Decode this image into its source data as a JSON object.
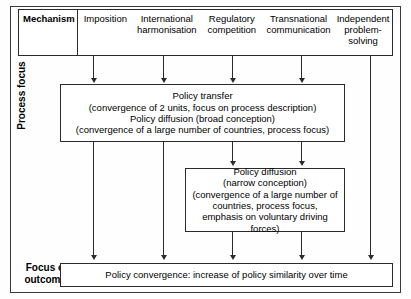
{
  "header": {
    "row_label": "Mechanism",
    "columns": [
      {
        "label": "Imposition"
      },
      {
        "label": "International harmonisation"
      },
      {
        "label": "Regulatory competition"
      },
      {
        "label": "Transnational communication"
      },
      {
        "label": "Independent problem-solving"
      }
    ]
  },
  "axis_labels": {
    "process_focus": "Process focus",
    "focus_on_outcomes": "Focus on\noutcomes",
    "focus_on_outcomes_line1": "Focus on",
    "focus_on_outcomes_line2": "outcomes"
  },
  "boxes": {
    "policy_transfer": {
      "name": "Policy transfer / Policy diffusion (broad conception)",
      "lines": [
        "Policy transfer",
        "(convergence of  2 units, focus on process description)",
        "Policy diffusion (broad conception)",
        "(convergence of a large number of countries, process focus)"
      ]
    },
    "policy_diffusion_narrow": {
      "name": "Policy diffusion (narrow conception)",
      "lines": [
        "Policy diffusion",
        "(narrow conception)",
        "(convergence of a large number of countries, process focus, emphasis on voluntary driving forces)"
      ]
    },
    "policy_convergence": {
      "name": "Policy convergence outcome",
      "lines": [
        "Policy convergence: increase of policy similarity over time"
      ]
    }
  },
  "connectors": [
    {
      "name": "imposition-to-policy-transfer",
      "column": "Imposition"
    },
    {
      "name": "international-harmonisation-to-policy-transfer",
      "column": "International harmonisation"
    },
    {
      "name": "regulatory-competition-to-policy-transfer",
      "column": "Regulatory competition"
    },
    {
      "name": "transnational-communication-to-policy-transfer",
      "column": "Transnational communication"
    },
    {
      "name": "regulatory-competition-to-policy-diffusion-narrow",
      "column": "Regulatory competition"
    },
    {
      "name": "transnational-communication-to-policy-diffusion-narrow",
      "column": "Transnational communication"
    },
    {
      "name": "imposition-to-policy-convergence",
      "column": "Imposition"
    },
    {
      "name": "international-harmonisation-to-policy-convergence",
      "column": "International harmonisation"
    },
    {
      "name": "regulatory-competition-to-policy-convergence",
      "column": "Regulatory competition"
    },
    {
      "name": "transnational-communication-to-policy-convergence",
      "column": "Transnational communication"
    },
    {
      "name": "independent-problem-solving-to-policy-convergence",
      "column": "Independent problem-solving"
    }
  ],
  "colors": {
    "line": "#2b2b2b",
    "frame": "#3a3a3a",
    "background": "#fefefe",
    "text": "#000000"
  }
}
